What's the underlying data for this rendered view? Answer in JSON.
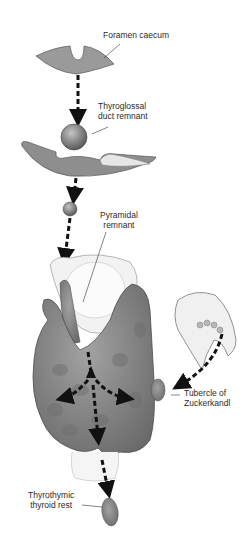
{
  "figure": {
    "labels": {
      "foramen_caecum": "Foramen caecum",
      "thyroglossal_line1": "Thyroglossal",
      "thyroglossal_line2": "duct remnant",
      "pyramidal_line1": "Pyramidal",
      "pyramidal_line2": "remnant",
      "tubercle_line1": "Tubercle of",
      "tubercle_line2": "Zuckerkandl",
      "thyrothymic_line1": "Thyrothymic",
      "thyrothymic_line2": "thyroid rest"
    },
    "colors": {
      "tissue": "#8a8a8a",
      "tissue_dark": "#5e5e5e",
      "arrow": "#111111",
      "text": "#2a2a2a"
    }
  }
}
